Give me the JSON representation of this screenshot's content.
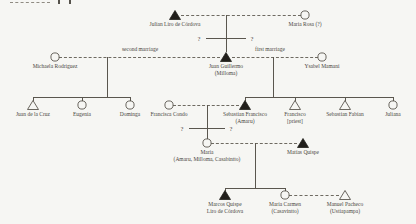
{
  "page": {
    "kind": "kinship-diagram",
    "background": "#f6f6f3"
  },
  "colors": {
    "line": "#5a564e",
    "dashed_line": "#6e6a61",
    "text": "#4a463f",
    "filled_symbol": "#211f1b"
  },
  "annotations": {
    "second_marriage": "second marriage",
    "first_marriage": "first marriage",
    "unknown_mark": "?"
  },
  "people": [
    {
      "id": "julian-liro-de-cordova",
      "name": "Julian Liro de Córdova",
      "symbol": "male-filled"
    },
    {
      "id": "maria-rosa",
      "name": "Maria Rosa (?)",
      "symbol": "female"
    },
    {
      "id": "michaela-rodriguez",
      "name": "Michaela Rodriguez",
      "symbol": "female"
    },
    {
      "id": "juan-guillermo",
      "name": "Juan Guillermo\n(Milloma)",
      "symbol": "male-filled"
    },
    {
      "id": "ysabel-mamani",
      "name": "Ysabel Mamani",
      "symbol": "female"
    },
    {
      "id": "juan-de-la-cruz",
      "name": "Juan de la Cruz",
      "symbol": "male"
    },
    {
      "id": "eugenia",
      "name": "Eugenia",
      "symbol": "female"
    },
    {
      "id": "dominga",
      "name": "Dominga",
      "symbol": "female"
    },
    {
      "id": "francisca-condo",
      "name": "Francisca Condo",
      "symbol": "female"
    },
    {
      "id": "sebastian-francisco",
      "name": "Sebastian Francisco\n(Amaru)",
      "symbol": "male-filled"
    },
    {
      "id": "francisco-priest",
      "name": "Francisco\n[priest]",
      "symbol": "male"
    },
    {
      "id": "sebastian-fabian",
      "name": "Sebastian Fabian",
      "symbol": "male"
    },
    {
      "id": "juliana",
      "name": "Juliana",
      "symbol": "female"
    },
    {
      "id": "maria",
      "name": "María\n(Amaru, Milloma, Casabintto)",
      "symbol": "female"
    },
    {
      "id": "matias-quispe",
      "name": "Matías Quispe",
      "symbol": "male-filled"
    },
    {
      "id": "marcos-quispe",
      "name": "Marcos Quispe\nLiro de Córdova",
      "symbol": "male-filled"
    },
    {
      "id": "maria-carmen",
      "name": "María Carmen\n(Casavintto)",
      "symbol": "female"
    },
    {
      "id": "manuel-pacheco",
      "name": "Manuel Pacheco\n(Ustiapampa)",
      "symbol": "male"
    }
  ]
}
